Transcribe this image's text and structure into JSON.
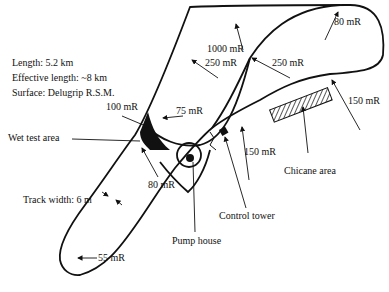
{
  "info": {
    "length": "Length:  5.2 km",
    "effective_length": "Effective length: ~8 km",
    "surface": "Surface:  Delugrip R.S.M."
  },
  "labels": {
    "r_80_top": "80 mR",
    "r_1000": "1000 mR",
    "r_250_left": "250 mR",
    "r_250_right": "250 mR",
    "r_150_right": "150 mR",
    "r_100": "100 mR",
    "r_75": "75 mR",
    "wet_test_area": "Wet test area",
    "r_80_mid": "80 mR",
    "r_150_mid": "150 mR",
    "chicane_area": "Chicane area",
    "track_width": "Track width:  6 m",
    "control_tower": "Control tower",
    "pump_house": "Pump house",
    "r_55": "55 mR"
  },
  "colors": {
    "ink": "#111111",
    "paper": "#ffffff"
  }
}
